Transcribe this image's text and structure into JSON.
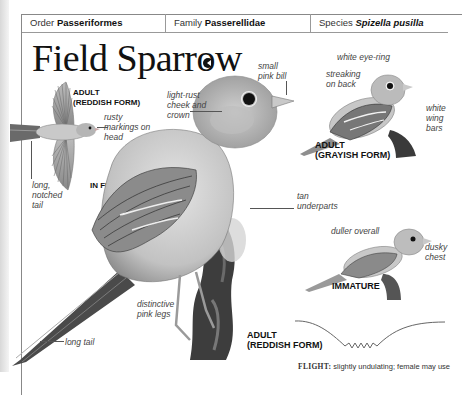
{
  "taxonomy": {
    "order_label": "Order",
    "order_value": "Passeriformes",
    "family_label": "Family",
    "family_value": "Passerellidae",
    "species_label": "Species",
    "species_value": "Spizella pusilla"
  },
  "title": "Field Sparrow",
  "sound_icon": "speaker-icon",
  "flight_figure": {
    "caption_line1": "ADULT",
    "caption_line2": "(REDDISH FORM)",
    "mode_caption": "IN FLIGHT",
    "labels": {
      "head": "rusty markings on head",
      "tail": "long, notched tail"
    }
  },
  "main_figure": {
    "caption_line1": "ADULT",
    "caption_line2": "(REDDISH FORM)",
    "labels": {
      "bill": "small pink bill",
      "cheek": "light-rust cheek and crown",
      "underparts": "tan underparts",
      "legs": "distinctive pink legs",
      "tail": "long tail"
    }
  },
  "grayish_figure": {
    "caption_line1": "ADULT",
    "caption_line2": "(GRAYISH FORM)",
    "labels": {
      "eye": "white eye-ring",
      "back": "streaking on back",
      "wing": "white wing bars"
    }
  },
  "immature_figure": {
    "caption": "IMMATURE",
    "labels": {
      "overall": "duller overall",
      "chest": "dusky chest"
    }
  },
  "flight_pattern": {
    "label": "FLIGHT:",
    "text": "slightly undulating; female may use"
  }
}
